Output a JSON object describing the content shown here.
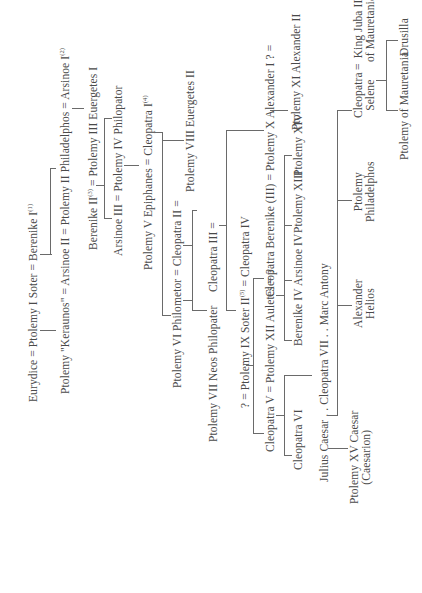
{
  "orientation": "rotated -90deg (text reads bottom-to-top)",
  "generations": [
    {
      "id": "g1",
      "text": "Eurydice = Ptolemy I Soter = Berenike I",
      "sup": "(1)"
    },
    {
      "id": "g2",
      "text": "Ptolemy \"Keraunos\" = Arsinoe II = Ptolemy II Philadelphos = Arsinoe I",
      "sup": "(2)"
    },
    {
      "id": "g3a",
      "text": "Berenike II",
      "sup": "(3)"
    },
    {
      "id": "g3b",
      "text": " = Ptolemy III Euergetes I"
    },
    {
      "id": "g4",
      "text": "Arsinoe III = Ptolemy IV Philopator"
    },
    {
      "id": "g5",
      "text": "Ptolemy V Epiphanes = Cleopatra I",
      "sup": "(4)"
    },
    {
      "id": "g6a",
      "text": "Ptolemy VI Philometor = Cleopatra II ="
    },
    {
      "id": "g6b",
      "text": "Ptolemy VIII Euergetes II"
    },
    {
      "id": "g7a",
      "text": "Ptolemy VII Neos Philopater"
    },
    {
      "id": "g7b",
      "text": "Cleopatra III ="
    },
    {
      "id": "g8a",
      "text": "? = Ptolemy IX Soter II"
    },
    {
      "id": "g8sup",
      "sup": "(5)"
    },
    {
      "id": "g8b",
      "text": " = Cleopatra IV"
    },
    {
      "id": "g9a",
      "text": "Cleopatra V = Ptolemy XII Auletes = ?"
    },
    {
      "id": "g9b",
      "text": "Cleopatra Berenike (III) = Ptolemy X Alexander I ? ="
    },
    {
      "id": "g9c",
      "text": "Ptolemy XI Alexander II"
    },
    {
      "id": "g10a",
      "text": "Cleopatra VI"
    },
    {
      "id": "g10b",
      "text": "Berenike IV"
    },
    {
      "id": "g10c",
      "text": "Arsinoe IV"
    },
    {
      "id": "g10d",
      "text": "Ptolemy XIII"
    },
    {
      "id": "g10e",
      "text": "Ptolemy XIV"
    },
    {
      "id": "g11",
      "text": "Julius Caesar . . Cleopatra VII . . Marc Antony"
    },
    {
      "id": "g12a",
      "text": "Ptolemy XV Caesar\n(Caesarion)"
    },
    {
      "id": "g12b",
      "text": "Alexander\nHelios"
    },
    {
      "id": "g12c",
      "text": "Ptolemy\nPhiladelphos"
    },
    {
      "id": "g12d",
      "text": "Cleopatra\nSelene"
    },
    {
      "id": "g12e",
      "text": "="
    },
    {
      "id": "g12f",
      "text": "King Juba II\nof Mauretania"
    },
    {
      "id": "g13a",
      "text": "Ptolemy of Mauretania"
    },
    {
      "id": "g13b",
      "text": "Drusilla"
    }
  ],
  "colors": {
    "text": "#4a4a4a",
    "lines": "#6a6a6a",
    "background": "#ffffff"
  }
}
